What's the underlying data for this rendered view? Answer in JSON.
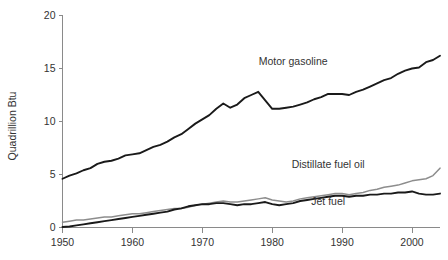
{
  "chart_data": {
    "type": "line",
    "title": "",
    "xlabel": "",
    "ylabel": "Quadrillion Btu",
    "xlim": [
      1950,
      2004
    ],
    "ylim": [
      0,
      20
    ],
    "xticks": [
      1950,
      1960,
      1970,
      1980,
      1990,
      2000
    ],
    "xtick_labels": [
      "1950",
      "1960",
      "1970",
      "1980",
      "1990",
      "2000"
    ],
    "yticks": [
      0,
      5,
      10,
      15,
      20
    ],
    "ytick_labels": [
      "0",
      "5",
      "10",
      "15",
      "20"
    ],
    "grid": false,
    "legend_position": "inline-annotations",
    "x": [
      1950,
      1951,
      1952,
      1953,
      1954,
      1955,
      1956,
      1957,
      1958,
      1959,
      1960,
      1961,
      1962,
      1963,
      1964,
      1965,
      1966,
      1967,
      1968,
      1969,
      1970,
      1971,
      1972,
      1973,
      1974,
      1975,
      1976,
      1977,
      1978,
      1979,
      1980,
      1981,
      1982,
      1983,
      1984,
      1985,
      1986,
      1987,
      1988,
      1989,
      1990,
      1991,
      1992,
      1993,
      1994,
      1995,
      1996,
      1997,
      1998,
      1999,
      2000,
      2001,
      2002,
      2003,
      2004
    ],
    "series": [
      {
        "name": "Motor gasoline",
        "color": "#1a1a1a",
        "width": 1.9,
        "label_x": 1983,
        "label_y": 15.3,
        "values": [
          4.6,
          4.9,
          5.1,
          5.4,
          5.6,
          6.0,
          6.2,
          6.3,
          6.5,
          6.8,
          6.9,
          7.0,
          7.3,
          7.6,
          7.8,
          8.1,
          8.5,
          8.8,
          9.3,
          9.8,
          10.2,
          10.6,
          11.2,
          11.7,
          11.3,
          11.6,
          12.2,
          12.5,
          12.8,
          12.0,
          11.2,
          11.2,
          11.3,
          11.4,
          11.6,
          11.8,
          12.1,
          12.3,
          12.6,
          12.6,
          12.6,
          12.5,
          12.8,
          13.0,
          13.3,
          13.6,
          13.9,
          14.1,
          14.5,
          14.8,
          15.0,
          15.1,
          15.6,
          15.8,
          16.2
        ]
      },
      {
        "name": "Distillate fuel oil",
        "color": "#8d8d8d",
        "width": 1.5,
        "label_x": 1988,
        "label_y": 5.6,
        "values": [
          0.5,
          0.6,
          0.7,
          0.7,
          0.8,
          0.9,
          1.0,
          1.0,
          1.1,
          1.2,
          1.3,
          1.3,
          1.4,
          1.5,
          1.6,
          1.7,
          1.8,
          1.8,
          1.9,
          2.1,
          2.2,
          2.3,
          2.4,
          2.5,
          2.4,
          2.4,
          2.5,
          2.6,
          2.7,
          2.8,
          2.6,
          2.5,
          2.4,
          2.5,
          2.7,
          2.8,
          2.9,
          3.0,
          3.1,
          3.2,
          3.2,
          3.1,
          3.2,
          3.3,
          3.5,
          3.6,
          3.8,
          3.9,
          4.0,
          4.2,
          4.4,
          4.5,
          4.6,
          4.9,
          5.6
        ]
      },
      {
        "name": "Jet fuel",
        "color": "#1a1a1a",
        "width": 1.9,
        "label_x": 1988,
        "label_y": 2.1,
        "values": [
          0.05,
          0.1,
          0.2,
          0.3,
          0.4,
          0.5,
          0.6,
          0.7,
          0.8,
          0.9,
          1.0,
          1.1,
          1.2,
          1.3,
          1.4,
          1.5,
          1.7,
          1.8,
          2.0,
          2.1,
          2.2,
          2.2,
          2.3,
          2.3,
          2.2,
          2.1,
          2.2,
          2.2,
          2.3,
          2.4,
          2.2,
          2.1,
          2.2,
          2.3,
          2.5,
          2.6,
          2.7,
          2.8,
          2.9,
          3.0,
          3.0,
          2.9,
          3.0,
          3.0,
          3.1,
          3.1,
          3.2,
          3.2,
          3.3,
          3.3,
          3.4,
          3.2,
          3.1,
          3.1,
          3.2
        ]
      }
    ]
  },
  "footer": {
    "clipped_caption": ""
  }
}
